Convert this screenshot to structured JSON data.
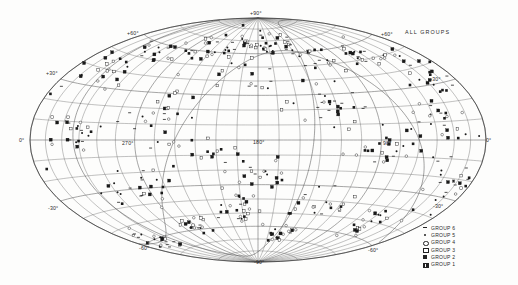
{
  "title": "ALL GROUPS",
  "chart_data": {
    "type": "scatter",
    "title": "ALL GROUPS",
    "projection": "aitoff-hammer-equal-area",
    "coordinate_system": "galactic",
    "xlabel": "",
    "ylabel": "",
    "grid": true,
    "legend_position": "bottom-right",
    "xlim": [
      0,
      360
    ],
    "ylim": [
      -90,
      90
    ],
    "longitude_ticks": [
      "0°",
      "270°",
      "180°",
      "90°",
      "0°"
    ],
    "latitude_ticks": [
      "+90°",
      "+60°",
      "+30°",
      "0°",
      "-30°",
      "-60°",
      "-90°"
    ],
    "grid_spacing_longitude_deg": 15,
    "grid_spacing_latitude_deg": 10,
    "series": [
      {
        "name": "GROUP 6",
        "symbol": "dash",
        "count": 118
      },
      {
        "name": "GROUP 5",
        "symbol": "filled-dot",
        "count": 96
      },
      {
        "name": "GROUP 4",
        "symbol": "open-circle",
        "count": 74
      },
      {
        "name": "GROUP 3",
        "symbol": "open-square",
        "count": 58
      },
      {
        "name": "GROUP 2",
        "symbol": "filled-square",
        "count": 64
      },
      {
        "name": "GROUP 1",
        "symbol": "hatched-square",
        "count": 42
      }
    ],
    "annotations": [
      "galactic equator trace",
      "supergalactic plane trace"
    ]
  },
  "axis_labels": {
    "lon_left_0": "0°",
    "lon_270": "270°",
    "lon_180": "180°",
    "lon_90": "90°",
    "lon_right_0": "0°",
    "lat_n90": "+90°",
    "lat_n60_left": "+60°",
    "lat_n60_right": "+60°",
    "lat_n30_left": "+30°",
    "lat_n30_right": "+30°",
    "lat_s30_left": "-30°",
    "lat_s30_right": "-30°",
    "lat_s60_left": "-60°",
    "lat_s60_right": "-60°",
    "lat_s90": "-90°"
  },
  "legend": {
    "items": [
      {
        "label": "GROUP 6",
        "symbol": "dash"
      },
      {
        "label": "GROUP 5",
        "symbol": "filled-dot"
      },
      {
        "label": "GROUP 4",
        "symbol": "open-circle"
      },
      {
        "label": "GROUP 3",
        "symbol": "open-square"
      },
      {
        "label": "GROUP 2",
        "symbol": "filled-square"
      },
      {
        "label": "GROUP 1",
        "symbol": "hatched-square"
      }
    ]
  },
  "colors": {
    "ink": "#222222",
    "grid": "#6a6a6a",
    "background": "#fdfdfc"
  }
}
